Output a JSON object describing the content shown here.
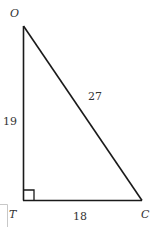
{
  "diagram": {
    "type": "right-triangle",
    "vertices": [
      {
        "name": "O",
        "label": "O",
        "x": 23,
        "y": 26
      },
      {
        "name": "T",
        "label": "T",
        "x": 23,
        "y": 200
      },
      {
        "name": "C",
        "label": "C",
        "x": 142,
        "y": 200
      }
    ],
    "right_angle_at": "T",
    "sides": [
      {
        "from": "O",
        "to": "T",
        "length_label": "19"
      },
      {
        "from": "T",
        "to": "C",
        "length_label": "18"
      },
      {
        "from": "O",
        "to": "C",
        "length_label": "27"
      }
    ],
    "colors": {
      "line": "#1a1a1a",
      "text": "#333333",
      "faint_box": "#c8c8c8"
    }
  }
}
